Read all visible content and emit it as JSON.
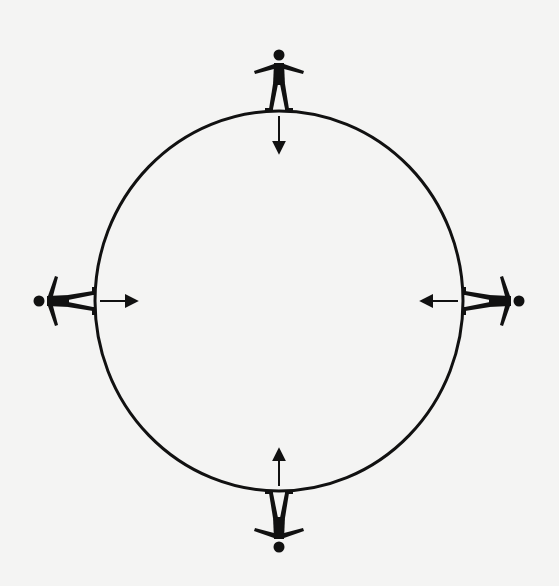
{
  "diagram": {
    "planet": {
      "shape": "circle",
      "color": "#111111"
    },
    "figures": [
      {
        "id": "top",
        "position": "top",
        "orientation": "upright",
        "arrow_direction": "toward-center"
      },
      {
        "id": "right",
        "position": "right",
        "orientation": "rotated-90-right",
        "arrow_direction": "toward-center"
      },
      {
        "id": "bottom",
        "position": "bottom",
        "orientation": "upside-down",
        "arrow_direction": "toward-center"
      },
      {
        "id": "left",
        "position": "left",
        "orientation": "rotated-90-left",
        "arrow_direction": "toward-center"
      }
    ],
    "background_color": "#f4f4f3",
    "ink_color": "#111111"
  }
}
